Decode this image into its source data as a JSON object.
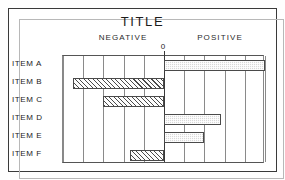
{
  "chart_data": {
    "type": "bar",
    "orientation": "horizontal",
    "title": "TITLE",
    "subtitle": "",
    "xlabel": "",
    "ylabel": "",
    "zero_label": "0",
    "left_header": "NEGATIVE",
    "right_header": "POSITIVE",
    "categories": [
      "ITEM A",
      "ITEM B",
      "ITEM C",
      "ITEM D",
      "ITEM E",
      "ITEM F"
    ],
    "values": [
      5.0,
      -4.5,
      -3.0,
      2.8,
      2.0,
      -1.7
    ],
    "xlim": [
      -5,
      5
    ],
    "xticks": [
      -5,
      -4,
      -3,
      -2,
      -1,
      0,
      1,
      2,
      3,
      4,
      5
    ],
    "xticklabels": [
      "",
      "",
      "",
      "",
      "",
      "0",
      "",
      "",
      "",
      "",
      ""
    ],
    "grid": true,
    "grid_axis": "x",
    "legend": "none",
    "series": [
      {
        "name": "value",
        "values": [
          5.0,
          -4.5,
          -3.0,
          2.8,
          2.0,
          -1.7
        ]
      }
    ],
    "bars": [
      {
        "category": "ITEM A",
        "value": 5.0,
        "sign": "positive",
        "fill": "stipple-gray"
      },
      {
        "category": "ITEM B",
        "value": -4.5,
        "sign": "negative",
        "fill": "diagonal-hatch"
      },
      {
        "category": "ITEM C",
        "value": -3.0,
        "sign": "negative",
        "fill": "diagonal-hatch"
      },
      {
        "category": "ITEM D",
        "value": 2.8,
        "sign": "positive",
        "fill": "stipple-gray"
      },
      {
        "category": "ITEM E",
        "value": 2.0,
        "sign": "positive",
        "fill": "stipple-gray"
      },
      {
        "category": "ITEM F",
        "value": -1.7,
        "sign": "negative",
        "fill": "diagonal-hatch"
      }
    ],
    "colors": {
      "positive_fill": "#d9d9d9",
      "negative_fill": "#ffffff",
      "bar_outline": "#4a4a4a",
      "gridline": "#8a8a8a",
      "zero_line": "#3a3a3a",
      "text": "#1c1c1c",
      "frame": "#3a3a3a"
    }
  }
}
